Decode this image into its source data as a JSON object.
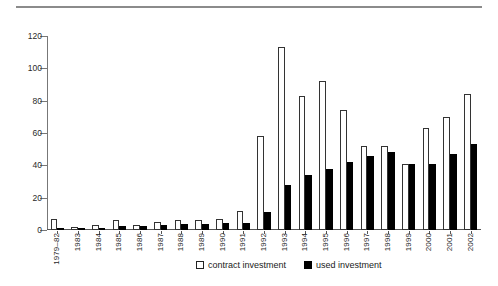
{
  "chart_data": {
    "type": "bar",
    "title": "",
    "xlabel": "",
    "ylabel": "",
    "ylim": [
      0,
      120
    ],
    "yticks": [
      0,
      20,
      40,
      60,
      80,
      100,
      120
    ],
    "grid": false,
    "legend_position": "bottom-center",
    "categories": [
      "1979–82",
      "1983",
      "1984",
      "1985",
      "1986",
      "1987",
      "1988",
      "1989",
      "1990",
      "1991",
      "1992",
      "1993",
      "1994",
      "1995",
      "1996",
      "1997",
      "1998",
      "1999",
      "2000",
      "2001",
      "2002"
    ],
    "series": [
      {
        "name": "contract investment",
        "color": "#ffffff",
        "values": [
          7,
          2,
          3,
          6,
          3,
          5,
          6,
          6,
          7,
          12,
          58,
          113,
          83,
          92,
          74,
          52,
          52,
          41,
          63,
          70,
          84
        ]
      },
      {
        "name": "used investment",
        "color": "#000000",
        "values": [
          1,
          0.5,
          1.5,
          2.5,
          2.5,
          3,
          4,
          4,
          4.5,
          4.5,
          11,
          28,
          34,
          38,
          42,
          46,
          48,
          41,
          41,
          47,
          53
        ]
      }
    ]
  },
  "legend": {
    "items": [
      {
        "label": "contract investment",
        "marker": "open-square"
      },
      {
        "label": "used investment",
        "marker": "filled-square"
      }
    ]
  }
}
